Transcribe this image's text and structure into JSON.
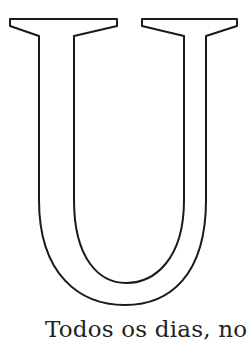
{
  "illustration": {
    "letter": "U",
    "style": "outline coloring page",
    "stroke_color": "#1a1a1a",
    "fill_color": "#ffffff"
  },
  "caption": {
    "text": "Todos os dias, no"
  }
}
